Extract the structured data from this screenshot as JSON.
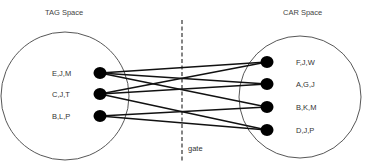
{
  "diagram": {
    "left_space": {
      "title": "TAG Space",
      "cx": 65,
      "cy": 96,
      "r": 64,
      "title_x": 45,
      "title_y": 15
    },
    "right_space": {
      "title": "CAR Space",
      "cx": 300,
      "cy": 97,
      "r": 61,
      "title_x": 283,
      "title_y": 15
    },
    "gate": {
      "label": "gate",
      "x": 182,
      "y1": 20,
      "y2": 162,
      "label_x": 188,
      "label_y": 151
    },
    "left_nodes": [
      {
        "id": "EJM",
        "label": "E,J,M",
        "x": 100,
        "y": 73,
        "label_x": 52
      },
      {
        "id": "CJT",
        "label": "C,J,T",
        "x": 100,
        "y": 94,
        "label_x": 52
      },
      {
        "id": "BLP",
        "label": "B,L,P",
        "x": 100,
        "y": 116,
        "label_x": 52
      }
    ],
    "right_nodes": [
      {
        "id": "FJW",
        "label": "F,J,W",
        "x": 267,
        "y": 62,
        "label_x": 296
      },
      {
        "id": "AGJ",
        "label": "A,G,J",
        "x": 267,
        "y": 84,
        "label_x": 296
      },
      {
        "id": "BKM",
        "label": "B,K,M",
        "x": 267,
        "y": 107,
        "label_x": 296
      },
      {
        "id": "DJP",
        "label": "D,J,P",
        "x": 267,
        "y": 130,
        "label_x": 296
      }
    ],
    "edges": [
      {
        "from": 0,
        "to": 0
      },
      {
        "from": 0,
        "to": 1
      },
      {
        "from": 0,
        "to": 2
      },
      {
        "from": 1,
        "to": 0
      },
      {
        "from": 1,
        "to": 1
      },
      {
        "from": 1,
        "to": 3
      },
      {
        "from": 2,
        "to": 2
      },
      {
        "from": 2,
        "to": 3
      }
    ],
    "colors": {
      "node": "#000000",
      "edge": "#111111",
      "circle": "#444444",
      "gate": "#333333"
    }
  }
}
